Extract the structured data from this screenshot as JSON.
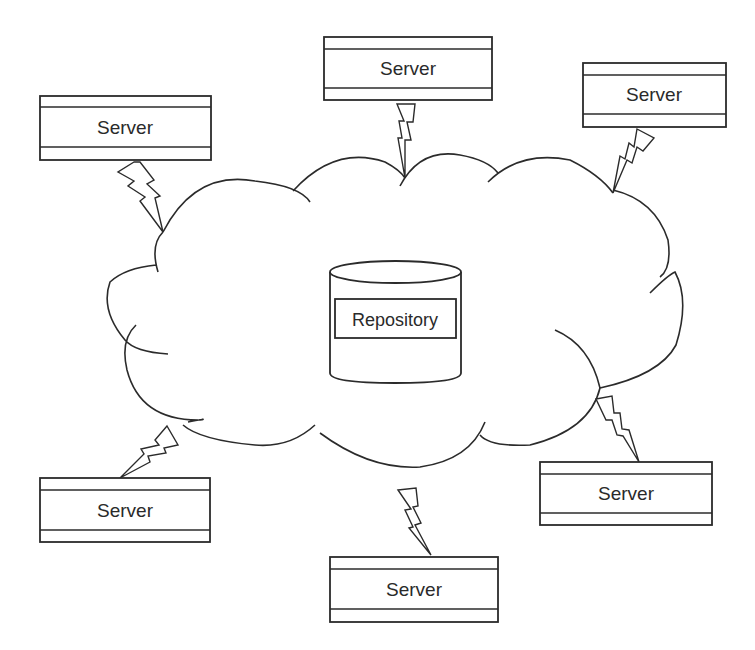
{
  "diagram": {
    "repository": {
      "label": "Repository"
    },
    "servers": [
      {
        "label": "Server",
        "position": "top-left"
      },
      {
        "label": "Server",
        "position": "top-center"
      },
      {
        "label": "Server",
        "position": "top-right"
      },
      {
        "label": "Server",
        "position": "bottom-left"
      },
      {
        "label": "Server",
        "position": "bottom-center"
      },
      {
        "label": "Server",
        "position": "bottom-right"
      }
    ],
    "connector_icon": "lightning-bolt-icon",
    "network_shape": "cloud-icon",
    "colors": {
      "stroke": "#2b2b2b",
      "background": "#ffffff",
      "text": "#2a2a2a"
    }
  }
}
